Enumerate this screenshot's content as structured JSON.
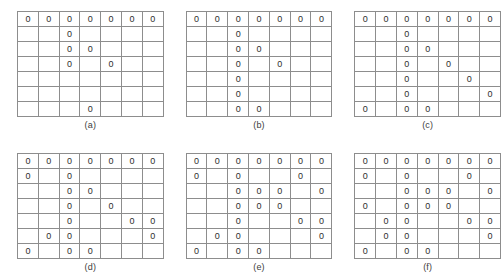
{
  "figure": {
    "symbol": "0",
    "rows": 7,
    "cols": 7,
    "border_color": "#8d8d8d",
    "text_color": "#2e2e2e",
    "background_color": "#ffffff"
  },
  "panels": [
    {
      "id": "a",
      "caption": "(a)",
      "grid": [
        [
          "0",
          "0",
          "0",
          "0",
          "0",
          "0",
          "0"
        ],
        [
          "",
          "",
          "0",
          "",
          "",
          "",
          ""
        ],
        [
          "",
          "",
          "0",
          "0",
          "",
          "",
          ""
        ],
        [
          "",
          "",
          "0",
          "",
          "0",
          "",
          ""
        ],
        [
          "",
          "",
          "",
          "",
          "",
          "",
          ""
        ],
        [
          "",
          "",
          "",
          "",
          "",
          "",
          ""
        ],
        [
          "",
          "",
          "",
          "0",
          "",
          "",
          ""
        ]
      ]
    },
    {
      "id": "b",
      "caption": "(b)",
      "grid": [
        [
          "0",
          "0",
          "0",
          "0",
          "0",
          "0",
          "0"
        ],
        [
          "",
          "",
          "0",
          "",
          "",
          "",
          ""
        ],
        [
          "",
          "",
          "0",
          "0",
          "",
          "",
          ""
        ],
        [
          "",
          "",
          "0",
          "",
          "0",
          "",
          ""
        ],
        [
          "",
          "",
          "0",
          "",
          "",
          "",
          ""
        ],
        [
          "",
          "",
          "0",
          "",
          "",
          "",
          ""
        ],
        [
          "",
          "",
          "0",
          "0",
          "",
          "",
          ""
        ]
      ]
    },
    {
      "id": "c",
      "caption": "(c)",
      "grid": [
        [
          "0",
          "0",
          "0",
          "0",
          "0",
          "0",
          "0"
        ],
        [
          "",
          "",
          "0",
          "",
          "",
          "",
          ""
        ],
        [
          "",
          "",
          "0",
          "0",
          "",
          "",
          ""
        ],
        [
          "",
          "",
          "0",
          "",
          "0",
          "",
          ""
        ],
        [
          "",
          "",
          "0",
          "",
          "",
          "0",
          ""
        ],
        [
          "",
          "",
          "0",
          "",
          "",
          "",
          "0"
        ],
        [
          "0",
          "",
          "0",
          "0",
          "",
          "",
          ""
        ]
      ]
    },
    {
      "id": "d",
      "caption": "(d)",
      "grid": [
        [
          "0",
          "0",
          "0",
          "0",
          "0",
          "0",
          "0"
        ],
        [
          "0",
          "",
          "0",
          "",
          "",
          "",
          ""
        ],
        [
          "",
          "",
          "0",
          "0",
          "",
          "",
          ""
        ],
        [
          "",
          "",
          "0",
          "",
          "0",
          "",
          ""
        ],
        [
          "",
          "",
          "0",
          "",
          "",
          "0",
          "0"
        ],
        [
          "",
          "0",
          "0",
          "",
          "",
          "",
          "0"
        ],
        [
          "0",
          "",
          "0",
          "0",
          "",
          "",
          ""
        ]
      ]
    },
    {
      "id": "e",
      "caption": "(e)",
      "grid": [
        [
          "0",
          "0",
          "0",
          "0",
          "0",
          "0",
          "0"
        ],
        [
          "0",
          "",
          "0",
          "",
          "",
          "0",
          ""
        ],
        [
          "",
          "",
          "0",
          "0",
          "0",
          "",
          "0"
        ],
        [
          "",
          "",
          "0",
          "0",
          "0",
          "",
          ""
        ],
        [
          "",
          "",
          "0",
          "",
          "",
          "0",
          "0"
        ],
        [
          "",
          "0",
          "0",
          "",
          "",
          "",
          "0"
        ],
        [
          "0",
          "",
          "0",
          "0",
          "",
          "",
          ""
        ]
      ]
    },
    {
      "id": "f",
      "caption": "(f)",
      "grid": [
        [
          "0",
          "0",
          "0",
          "0",
          "0",
          "0",
          "0"
        ],
        [
          "0",
          "",
          "0",
          "",
          "",
          "0",
          ""
        ],
        [
          "",
          "",
          "0",
          "0",
          "0",
          "",
          "0"
        ],
        [
          "0",
          "",
          "0",
          "0",
          "0",
          "",
          ""
        ],
        [
          "",
          "0",
          "0",
          "",
          "",
          "0",
          "0"
        ],
        [
          "",
          "0",
          "0",
          "",
          "",
          "",
          "0"
        ],
        [
          "0",
          "",
          "0",
          "0",
          "",
          "",
          ""
        ]
      ]
    }
  ]
}
